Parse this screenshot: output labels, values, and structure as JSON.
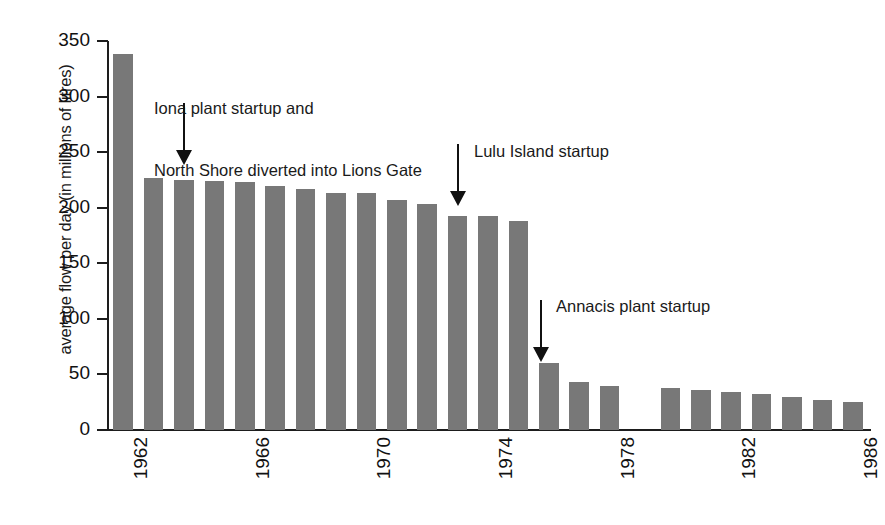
{
  "chart_data": {
    "type": "bar",
    "title": "",
    "xlabel": "",
    "ylabel": "average flow per day (in millions of litres)",
    "ylim": [
      0,
      350
    ],
    "ytick_values": [
      0,
      50,
      100,
      150,
      200,
      250,
      300,
      350
    ],
    "ytick_labels": [
      "0",
      "50",
      "100",
      "150",
      "200",
      "250",
      "300",
      "350"
    ],
    "xtick_labels": [
      "1962",
      "1966",
      "1970",
      "1974",
      "1978",
      "1982",
      "1986"
    ],
    "grid": false,
    "legend": "none",
    "bar_color": "#787878",
    "categories": [
      "1962",
      "1963",
      "1964",
      "1965",
      "1966",
      "1967",
      "1968",
      "1969",
      "1970",
      "1971",
      "1972",
      "1973",
      "1974",
      "1975",
      "1976",
      "1977",
      "1978",
      "1979",
      "1980",
      "1981",
      "1982",
      "1983",
      "1984",
      "1985",
      "1986"
    ],
    "values": [
      338,
      227,
      225,
      224,
      223,
      220,
      217,
      213,
      213,
      207,
      203,
      193,
      193,
      188,
      60,
      43,
      40,
      0,
      38,
      36,
      34,
      32,
      30,
      27,
      25
    ],
    "annotations": [
      {
        "id": "iona",
        "text": "Iona plant startup and\nNorth Shore diverted into Lions Gate",
        "points_to_category": "1963"
      },
      {
        "id": "lulu",
        "text": "Lulu Island startup",
        "points_to_category": "1973"
      },
      {
        "id": "annacis",
        "text": "Annacis plant startup",
        "points_to_category": "1976"
      }
    ]
  },
  "axis": {
    "y_title": "average flow per day (in millions of litres)"
  },
  "annotations": {
    "iona_line1": "Iona plant startup and",
    "iona_line2": "North Shore diverted into Lions Gate",
    "lulu": "Lulu Island startup",
    "annacis": "Annacis plant startup"
  }
}
